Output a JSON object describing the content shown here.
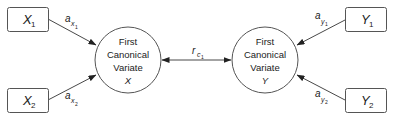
{
  "diagram": {
    "left_variables": [
      {
        "name": "X",
        "subscript": "1",
        "weight_label": {
          "base": "a",
          "sub": "x",
          "subsub": "1"
        }
      },
      {
        "name": "X",
        "subscript": "2",
        "weight_label": {
          "base": "a",
          "sub": "x",
          "subsub": "2"
        }
      }
    ],
    "right_variables": [
      {
        "name": "Y",
        "subscript": "1",
        "weight_label": {
          "base": "a",
          "sub": "y",
          "subsub": "1"
        }
      },
      {
        "name": "Y",
        "subscript": "2",
        "weight_label": {
          "base": "a",
          "sub": "y",
          "subsub": "2"
        }
      }
    ],
    "left_variate": {
      "line1": "First",
      "line2": "Canonical",
      "line3": "Variate",
      "symbol": "X"
    },
    "right_variate": {
      "line1": "First",
      "line2": "Canonical",
      "line3": "Variate",
      "symbol": "Y"
    },
    "correlation_label": {
      "base": "r",
      "sub": "c",
      "subsub": "1"
    },
    "colors": {
      "stroke": "#555555",
      "text": "#222222",
      "background": "#ffffff"
    }
  }
}
